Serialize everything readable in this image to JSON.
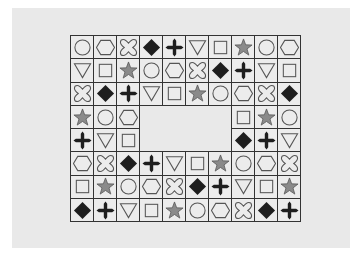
{
  "puzzle": {
    "rows": 8,
    "cols": 10,
    "hole": {
      "row_start": 3,
      "row_end": 4,
      "col_start": 3,
      "col_end": 6
    },
    "colors": {
      "stroke": "#555555",
      "filled": "#1e1e1e",
      "star_fill": "#8a8a8a",
      "grid_line": "#333333",
      "cell_bg": "#ececec",
      "paper_bg": "#e9e9e9"
    },
    "grid": [
      [
        "circle",
        "hexagon",
        "cross",
        "diamond",
        "plus",
        "triangle",
        "square",
        "star",
        "circle",
        "hexagon"
      ],
      [
        "triangle",
        "square",
        "star",
        "circle",
        "hexagon",
        "cross",
        "diamond",
        "plus",
        "triangle",
        "square"
      ],
      [
        "cross",
        "diamond",
        "plus",
        "triangle",
        "square",
        "star",
        "circle",
        "hexagon",
        "cross",
        "diamond"
      ],
      [
        "star",
        "circle",
        "hexagon",
        null,
        null,
        null,
        null,
        "square",
        "star",
        "circle"
      ],
      [
        "plus",
        "triangle",
        "square",
        null,
        null,
        null,
        null,
        "diamond",
        "plus",
        "triangle"
      ],
      [
        "hexagon",
        "cross",
        "diamond",
        "plus",
        "triangle",
        "square",
        "star",
        "circle",
        "hexagon",
        "cross"
      ],
      [
        "square",
        "star",
        "circle",
        "hexagon",
        "cross",
        "diamond",
        "plus",
        "triangle",
        "square",
        "star"
      ],
      [
        "diamond",
        "plus",
        "triangle",
        "square",
        "star",
        "circle",
        "hexagon",
        "cross",
        "diamond",
        "plus"
      ]
    ]
  }
}
